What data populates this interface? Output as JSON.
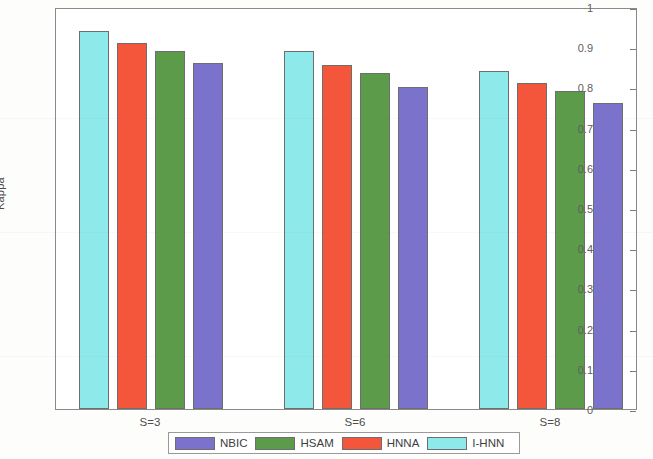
{
  "chart_data": {
    "type": "bar",
    "title": "",
    "xlabel": "",
    "ylabel": "Kappa",
    "categories": [
      "S=3",
      "S=6",
      "S=8"
    ],
    "ylim": [
      0,
      1
    ],
    "ytick_labels": [
      "0",
      "0.1",
      "0.2",
      "0.3",
      "0.4",
      "0.5",
      "0.6",
      "0.7",
      "0.8",
      "0.9",
      "1"
    ],
    "ytick_values": [
      0,
      0.1,
      0.2,
      0.3,
      0.4,
      0.5,
      0.6,
      0.7,
      0.8,
      0.9,
      1
    ],
    "grid": false,
    "legend_position": "bottom-outside",
    "series": [
      {
        "name": "I-HNN",
        "color": "#8EEAEA",
        "values": [
          0.94,
          0.89,
          0.84
        ]
      },
      {
        "name": "HNNA",
        "color": "#F4563C",
        "values": [
          0.91,
          0.855,
          0.81
        ]
      },
      {
        "name": "HSAM",
        "color": "#5C9B4A",
        "values": [
          0.89,
          0.835,
          0.79
        ]
      },
      {
        "name": "NBIC",
        "color": "#7B72CC",
        "values": [
          0.86,
          0.8,
          0.76
        ]
      }
    ],
    "legend_order": [
      "NBIC",
      "HSAM",
      "HNNA",
      "I-HNN"
    ]
  },
  "legend": {
    "entries": [
      {
        "label": "NBIC",
        "color": "#7B72CC"
      },
      {
        "label": "HSAM",
        "color": "#5C9B4A"
      },
      {
        "label": "HNNA",
        "color": "#F4563C"
      },
      {
        "label": "I-HNN",
        "color": "#8EEAEA"
      }
    ]
  },
  "axes": {
    "y_title": "Kappa",
    "y_labels": [
      "1",
      "0.9",
      "0.8",
      "0.7",
      "0.6",
      "0.5",
      "0.4",
      "0.3",
      "0.2",
      "0.1",
      "0"
    ],
    "x_labels": [
      "S=3",
      "S=6",
      "S=8"
    ]
  }
}
